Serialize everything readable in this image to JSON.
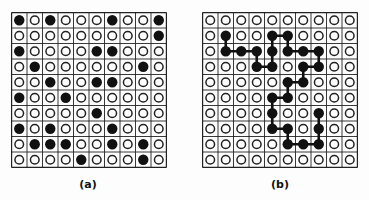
{
  "figure": {
    "panels": [
      {
        "id": "a",
        "label": "(a)",
        "rows": 10,
        "cols": 10,
        "grid": [
          [
            1,
            0,
            1,
            0,
            0,
            0,
            1,
            0,
            0,
            1
          ],
          [
            0,
            0,
            0,
            0,
            0,
            0,
            0,
            0,
            0,
            1
          ],
          [
            1,
            0,
            0,
            0,
            0,
            1,
            1,
            0,
            0,
            0
          ],
          [
            0,
            1,
            0,
            0,
            0,
            0,
            0,
            0,
            1,
            0
          ],
          [
            0,
            0,
            1,
            0,
            0,
            1,
            1,
            0,
            0,
            0
          ],
          [
            1,
            0,
            0,
            1,
            0,
            0,
            0,
            0,
            0,
            0
          ],
          [
            0,
            0,
            0,
            0,
            0,
            1,
            0,
            0,
            0,
            0
          ],
          [
            1,
            0,
            1,
            0,
            0,
            0,
            1,
            0,
            0,
            0
          ],
          [
            0,
            1,
            1,
            1,
            0,
            0,
            1,
            0,
            1,
            0
          ],
          [
            0,
            0,
            0,
            0,
            1,
            0,
            0,
            0,
            1,
            0
          ]
        ],
        "path": []
      },
      {
        "id": "b",
        "label": "(b)",
        "rows": 10,
        "cols": 10,
        "grid": [
          [
            0,
            0,
            0,
            0,
            0,
            0,
            0,
            0,
            0,
            0
          ],
          [
            0,
            1,
            0,
            0,
            1,
            1,
            0,
            0,
            0,
            0
          ],
          [
            0,
            1,
            1,
            1,
            1,
            1,
            1,
            1,
            0,
            0
          ],
          [
            0,
            0,
            0,
            1,
            1,
            0,
            1,
            1,
            0,
            0
          ],
          [
            0,
            0,
            0,
            0,
            0,
            1,
            1,
            0,
            0,
            0
          ],
          [
            0,
            0,
            0,
            0,
            1,
            1,
            0,
            0,
            0,
            0
          ],
          [
            0,
            0,
            0,
            0,
            1,
            0,
            0,
            1,
            0,
            0
          ],
          [
            0,
            0,
            0,
            0,
            1,
            1,
            0,
            1,
            0,
            0
          ],
          [
            0,
            0,
            0,
            0,
            0,
            1,
            1,
            1,
            0,
            0
          ],
          [
            0,
            0,
            0,
            0,
            0,
            0,
            0,
            0,
            0,
            0
          ]
        ],
        "path": [
          [
            1,
            1
          ],
          [
            2,
            1
          ],
          [
            2,
            2
          ],
          [
            2,
            3
          ],
          [
            3,
            3
          ],
          [
            3,
            4
          ],
          [
            2,
            4
          ],
          [
            1,
            4
          ],
          [
            1,
            5
          ],
          [
            2,
            5
          ],
          [
            2,
            6
          ],
          [
            2,
            7
          ],
          [
            3,
            7
          ],
          [
            3,
            6
          ],
          [
            4,
            6
          ],
          [
            4,
            5
          ],
          [
            5,
            5
          ],
          [
            5,
            4
          ],
          [
            6,
            4
          ],
          [
            7,
            4
          ],
          [
            7,
            5
          ],
          [
            8,
            5
          ],
          [
            8,
            6
          ],
          [
            8,
            7
          ],
          [
            7,
            7
          ],
          [
            6,
            7
          ]
        ]
      }
    ],
    "colors": {
      "filled": "#111111",
      "open_stroke": "#222222",
      "grid_line": "#222222",
      "background": "#fdfdfd"
    }
  }
}
